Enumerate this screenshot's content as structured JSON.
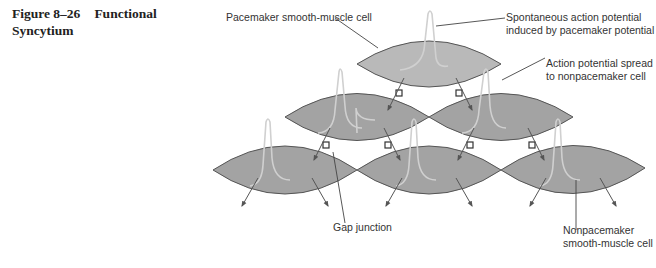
{
  "figure": {
    "number": "Figure 8–26",
    "title_line1": "Functional",
    "title_line2": "Syncytium"
  },
  "labels": {
    "pacemaker_cell": "Pacemaker smooth-muscle cell",
    "spontaneous_ap_line1": "Spontaneous action potential",
    "spontaneous_ap_line2": "induced by pacemaker potential",
    "ap_spread_line1": "Action potential spread",
    "ap_spread_line2": "to nonpacemaker cell",
    "gap_junction": "Gap junction",
    "nonpacemaker_line1": "Nonpacemaker",
    "nonpacemaker_line2": "smooth-muscle cell"
  },
  "colors": {
    "pacemaker_fill": "#b9b9b9",
    "nonpacemaker_fill": "#a3a3a3",
    "outline": "#555555",
    "trace": "#cfcfcf",
    "arrow": "#555555"
  },
  "cells": {
    "rows": [
      {
        "row": 1,
        "count": 1,
        "type": "pacemaker"
      },
      {
        "row": 2,
        "count": 2,
        "type": "nonpacemaker"
      },
      {
        "row": 3,
        "count": 3,
        "type": "nonpacemaker"
      }
    ]
  }
}
